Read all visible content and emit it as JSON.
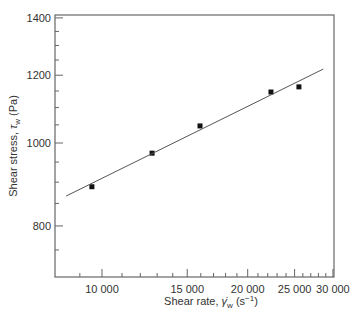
{
  "chart_data": {
    "type": "scatter",
    "title": "",
    "xlabel": "Shear rate, γ̇w (s⁻¹)",
    "ylabel": "Shear stress, τw (Pa)",
    "xlabel_parts": {
      "main": "Shear rate, ",
      "symbol": "γ̇",
      "sub": "w",
      "unit_open": " (s",
      "sup": "−1",
      "unit_close": ")"
    },
    "ylabel_parts": {
      "main": "Shear stress, ",
      "symbol": "τ",
      "sub": "w",
      "unit": " (Pa)"
    },
    "x_scale": "log",
    "y_scale": "log",
    "xlim": [
      8000,
      30000
    ],
    "ylim": [
      710,
      1400
    ],
    "x_ticks": [
      10000,
      15000,
      20000,
      25000,
      30000
    ],
    "x_tick_labels": [
      "10 000",
      "15 000",
      "20 000",
      "25 000",
      "30 000"
    ],
    "y_ticks": [
      800,
      1000,
      1200,
      1400
    ],
    "y_tick_labels": [
      "800",
      "1000",
      "1200",
      "1400"
    ],
    "x_minor_step": 1000,
    "y_minor_step": 50,
    "grid": false,
    "legend": null,
    "series": [
      {
        "name": "measured",
        "marker": "square",
        "color": "#111111",
        "x": [
          9530,
          12690,
          15940,
          22340,
          25520
        ],
        "y": [
          889,
          973,
          1047,
          1147,
          1163
        ]
      },
      {
        "name": "fit",
        "style": "line",
        "color": "#555555",
        "x": [
          8430,
          28650
        ],
        "y": [
          867,
          1220
        ]
      }
    ]
  }
}
